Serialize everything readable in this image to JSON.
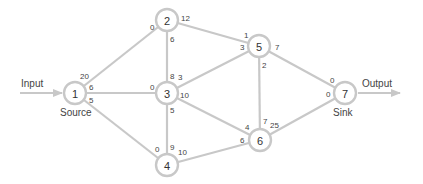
{
  "diagram": {
    "type": "flow-network",
    "input_label": "Input",
    "output_label": "Output",
    "source_label": "Source",
    "sink_label": "Sink",
    "colors": {
      "edge": "#c8c8c8",
      "node_stroke": "#c8c8c8",
      "text": "#444444"
    },
    "nodes": [
      {
        "id": "1",
        "x": 75,
        "y": 93
      },
      {
        "id": "2",
        "x": 167,
        "y": 20
      },
      {
        "id": "3",
        "x": 167,
        "y": 93
      },
      {
        "id": "4",
        "x": 167,
        "y": 165
      },
      {
        "id": "5",
        "x": 259,
        "y": 46
      },
      {
        "id": "6",
        "x": 260,
        "y": 140
      },
      {
        "id": "7",
        "x": 345,
        "y": 93
      }
    ],
    "edges": [
      {
        "from": "1",
        "to": "2",
        "cap_from": "20",
        "cap_to": "0"
      },
      {
        "from": "1",
        "to": "3",
        "cap_from": "6",
        "cap_to": "0"
      },
      {
        "from": "1",
        "to": "4",
        "cap_from": "5",
        "cap_to": "0"
      },
      {
        "from": "2",
        "to": "3",
        "cap_from": "6",
        "cap_to": "8"
      },
      {
        "from": "2",
        "to": "5",
        "cap_from": "12",
        "cap_to": "1"
      },
      {
        "from": "3",
        "to": "5",
        "cap_from": "3",
        "cap_to": "3"
      },
      {
        "from": "3",
        "to": "4",
        "cap_from": "5",
        "cap_to": "9"
      },
      {
        "from": "3",
        "to": "6",
        "cap_from": "10",
        "cap_to": "4"
      },
      {
        "from": "4",
        "to": "6",
        "cap_from": "10",
        "cap_to": "6"
      },
      {
        "from": "5",
        "to": "6",
        "cap_from": "2",
        "cap_to": "7"
      },
      {
        "from": "5",
        "to": "7",
        "cap_from": "7",
        "cap_to": "0"
      },
      {
        "from": "6",
        "to": "7",
        "cap_from": "25",
        "cap_to": "0"
      }
    ],
    "caps": {
      "e12_from": "20",
      "e12_to": "0",
      "e13_from": "6",
      "e13_to": "0",
      "e14_from": "5",
      "e14_to": "0",
      "e23_from": "6",
      "e23_to": "8",
      "e25_from": "12",
      "e25_to": "1",
      "e35_from": "3",
      "e35_to": "3",
      "e34_from": "5",
      "e34_to": "9",
      "e36_from": "10",
      "e36_to": "4",
      "e46_from": "10",
      "e46_to": "6",
      "e56_from": "2",
      "e56_to": "7",
      "e57_from": "7",
      "e57_to": "0",
      "e67_from": "25",
      "e67_to": "0"
    },
    "node_labels": {
      "n1": "1",
      "n2": "2",
      "n3": "3",
      "n4": "4",
      "n5": "5",
      "n6": "6",
      "n7": "7"
    }
  }
}
